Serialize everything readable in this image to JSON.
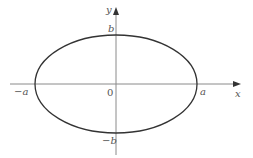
{
  "diagram": {
    "type": "ellipse-on-axes",
    "colors": {
      "axis": "#8a8a8a",
      "curve": "#333333",
      "label": "#555555",
      "background": "#ffffff"
    },
    "axes": {
      "x_label": "x",
      "y_label": "y",
      "origin_label": "0"
    },
    "ellipse": {
      "semi_major_label": "a",
      "neg_semi_major_label": "−a",
      "semi_minor_label": "b",
      "neg_semi_minor_label": "−b"
    }
  }
}
